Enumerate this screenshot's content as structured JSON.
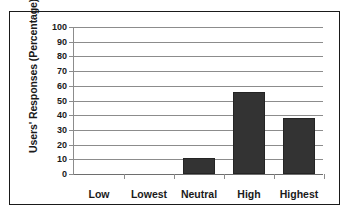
{
  "chart_data": {
    "type": "bar",
    "title": "",
    "xlabel": "",
    "ylabel": "Users' Responses (Percentage)",
    "categories": [
      "Low",
      "Lowest",
      "Neutral",
      "High",
      "Highest"
    ],
    "values": [
      0,
      0,
      11,
      56,
      38
    ],
    "series": [
      {
        "name": "Users' Responses",
        "values": [
          0,
          0,
          11,
          56,
          38
        ]
      }
    ],
    "ylim": [
      0,
      100
    ],
    "ytick_labels": [
      "100",
      "90",
      "80",
      "70",
      "60",
      "50",
      "40",
      "30",
      "20",
      "10",
      "0"
    ],
    "ytick_values": [
      100,
      90,
      80,
      70,
      60,
      50,
      40,
      30,
      20,
      10,
      0
    ],
    "ytick_step": 10,
    "grid": true,
    "grid_axis": "y",
    "legend": false,
    "legend_position": "none",
    "bar_color": "#333333",
    "grid_color": "#8c8c8c",
    "frame_color": "#1a1a1a",
    "text_color": "#1a1a1a",
    "background": "#ffffff"
  }
}
